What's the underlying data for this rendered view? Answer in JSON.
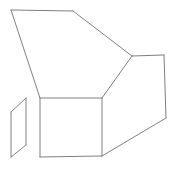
{
  "figure": {
    "type": "line-drawing",
    "background_color": "#ffffff",
    "stroke_color": "#808080",
    "fill_color": "#ffffff",
    "stroke_width": 1,
    "canvas": {
      "width": 171,
      "height": 170
    },
    "shapes": [
      {
        "name": "box-top-face",
        "label": "Top face",
        "points": "11,10 73,11 132,56 102,98 40,98",
        "closed": true
      },
      {
        "name": "box-front-face",
        "label": "Front face",
        "points": "40,98 102,98 102,156 40,157",
        "closed": true
      },
      {
        "name": "box-right-face",
        "label": "Right side face",
        "points": "132,56 164,55 166,118 102,156 102,98",
        "closed": true
      },
      {
        "name": "side-flap",
        "label": "Detached side flap",
        "points": "26,98 26,145 11,157 11,112",
        "closed": true
      }
    ],
    "edges": [
      {
        "name": "top-edge",
        "x1": 11,
        "y1": 10,
        "x2": 73,
        "y2": 11
      },
      {
        "name": "upper-right-diagonal",
        "x1": 73,
        "y1": 11,
        "x2": 132,
        "y2": 56
      },
      {
        "name": "left-long-diagonal",
        "x1": 11,
        "y1": 10,
        "x2": 40,
        "y2": 98
      },
      {
        "name": "top-face-front-left-edge",
        "x1": 40,
        "y1": 98,
        "x2": 102,
        "y2": 98
      },
      {
        "name": "top-face-right-fold",
        "x1": 102,
        "y1": 98,
        "x2": 132,
        "y2": 56
      },
      {
        "name": "right-top-edge",
        "x1": 132,
        "y1": 56,
        "x2": 164,
        "y2": 55
      },
      {
        "name": "right-vertical-edge",
        "x1": 164,
        "y1": 55,
        "x2": 166,
        "y2": 118
      },
      {
        "name": "right-bottom-diagonal",
        "x1": 166,
        "y1": 118,
        "x2": 102,
        "y2": 156
      },
      {
        "name": "front-left-vertical",
        "x1": 40,
        "y1": 98,
        "x2": 40,
        "y2": 157
      },
      {
        "name": "front-right-vertical",
        "x1": 102,
        "y1": 98,
        "x2": 102,
        "y2": 156
      },
      {
        "name": "front-bottom-edge",
        "x1": 40,
        "y1": 157,
        "x2": 102,
        "y2": 156
      },
      {
        "name": "flap-right-vertical",
        "x1": 26,
        "y1": 98,
        "x2": 26,
        "y2": 145
      },
      {
        "name": "flap-bottom-diagonal",
        "x1": 26,
        "y1": 145,
        "x2": 11,
        "y2": 157
      },
      {
        "name": "flap-left-vertical",
        "x1": 11,
        "y1": 157,
        "x2": 11,
        "y2": 112
      },
      {
        "name": "flap-top-diagonal",
        "x1": 11,
        "y1": 112,
        "x2": 26,
        "y2": 98
      }
    ]
  }
}
